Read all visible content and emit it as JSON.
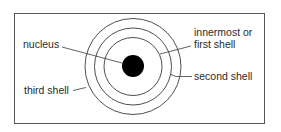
{
  "diagram": {
    "type": "atomic-shell-model",
    "labels": {
      "nucleus": "nucleus",
      "first_shell_line1": "innermost or",
      "first_shell_line2": "first shell",
      "second_shell": "second shell",
      "third_shell": "third shell"
    },
    "colors": {
      "line": "#3a3a3a",
      "nucleus": "#000000",
      "text": "#2a2a2a",
      "background": "#ffffff"
    }
  }
}
